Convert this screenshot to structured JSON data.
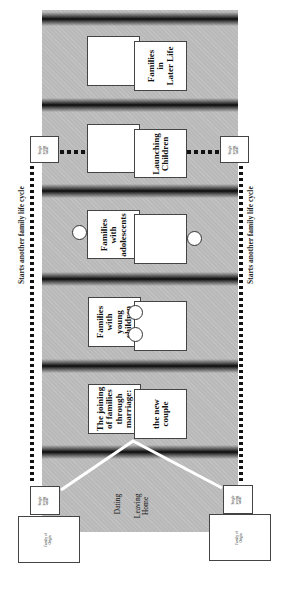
{
  "diagram": {
    "title": "Family life cycle",
    "stages": [
      {
        "id": "later-life",
        "label": "Families\nin\nLater Life"
      },
      {
        "id": "launching",
        "label": "Launching\nChildren"
      },
      {
        "id": "adolescents",
        "label": "Families\nwith\nadolescents"
      },
      {
        "id": "young-children",
        "label": "Families\nwith\nyoung\nchildren"
      },
      {
        "id": "marriage",
        "label": "The joining\nof families\nthrough\nmarriage:",
        "sub_label": "the new\ncouple"
      }
    ],
    "pre_stage": {
      "dating": "Dating",
      "leaving_home": "Leaving\nHome"
    },
    "single_young_adult": "Single\nyoung\nadult",
    "family_of_origin": "Family of\nOrigin",
    "side_label_left": "Starts another family life cycle",
    "side_label_right": "Starts another family life cycle",
    "colors": {
      "panel": "#b9b9b9",
      "band": "#0b0b0b",
      "box": "#ffffff",
      "connector": "#ffffff"
    }
  }
}
